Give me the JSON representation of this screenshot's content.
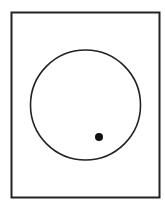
{
  "diagram": {
    "background": "#ffffff",
    "stroke_color": "#222222",
    "frame": {
      "x": 11.5,
      "y": 12.5,
      "width": 148,
      "height": 185,
      "stroke_width": 2
    },
    "circle": {
      "cx": 85.5,
      "cy": 105,
      "r": 55,
      "stroke_width": 1.6
    },
    "dot": {
      "cx": 99,
      "cy": 137,
      "r": 4,
      "fill": "#111111"
    }
  }
}
